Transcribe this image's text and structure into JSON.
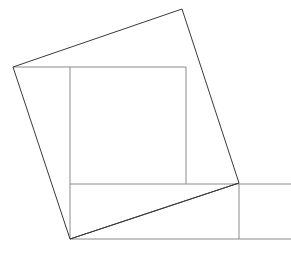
{
  "page": {
    "background_color": "#ffffff",
    "width": 291,
    "height": 255
  },
  "figure": {
    "name": "tilted-quadrilateral-with-inscribed-rectangle",
    "stroke_color": "#3a3a3a",
    "stroke_color_light": "#8c8c8c",
    "stroke_width": 1,
    "vertices": {
      "left": {
        "label": "left-vertex",
        "x": 13,
        "y": 67
      },
      "top": {
        "label": "top-vertex",
        "x": 182,
        "y": 9
      },
      "right": {
        "label": "right-vertex",
        "x": 239,
        "y": 183
      },
      "bottom": {
        "label": "bottom-vertex",
        "x": 70,
        "y": 239
      }
    },
    "rectangle": {
      "label": "inner-rectangle",
      "left": 70,
      "right": 186,
      "top": 67,
      "bottom": 184
    },
    "paths": {
      "quad_outline": "M 13 67 L 182 9 L 239 183 L 70 239 Z",
      "rect_top_edge": "M 13 67 L 186 67",
      "rect_left_edge": "M 70 67 L 70 239",
      "rect_right_edge": "M 186 67 L 186 184",
      "rect_bottom_edge": "M 70 184 L 291 184",
      "diagonal_bottom_to_right": "M 70 239 L 239 183",
      "baseline_horizontal": "M 70 239 L 291 239",
      "right_vertical": "M 239 184 L 239 239"
    },
    "segments": [
      {
        "name": "quad-edge-left-top",
        "x1": 13,
        "y1": 67,
        "x2": 182,
        "y2": 9,
        "shade": "dark"
      },
      {
        "name": "quad-edge-top-right",
        "x1": 182,
        "y1": 9,
        "x2": 239,
        "y2": 183,
        "shade": "dark"
      },
      {
        "name": "quad-edge-right-bottom",
        "x1": 239,
        "y1": 183,
        "x2": 70,
        "y2": 239,
        "shade": "dark"
      },
      {
        "name": "quad-edge-bottom-left",
        "x1": 70,
        "y1": 239,
        "x2": 13,
        "y2": 67,
        "shade": "dark"
      },
      {
        "name": "rect-top-edge",
        "x1": 13,
        "y1": 67,
        "x2": 186,
        "y2": 67,
        "shade": "light"
      },
      {
        "name": "rect-left-edge",
        "x1": 70,
        "y1": 67,
        "x2": 70,
        "y2": 239,
        "shade": "light"
      },
      {
        "name": "rect-right-edge",
        "x1": 186,
        "y1": 67,
        "x2": 186,
        "y2": 184,
        "shade": "light"
      },
      {
        "name": "rect-bottom-edge",
        "x1": 70,
        "y1": 184,
        "x2": 291,
        "y2": 184,
        "shade": "light"
      },
      {
        "name": "baseline-horizontal",
        "x1": 70,
        "y1": 239,
        "x2": 291,
        "y2": 239,
        "shade": "light"
      },
      {
        "name": "right-vertical",
        "x1": 239,
        "y1": 184,
        "x2": 239,
        "y2": 239,
        "shade": "light"
      }
    ]
  }
}
